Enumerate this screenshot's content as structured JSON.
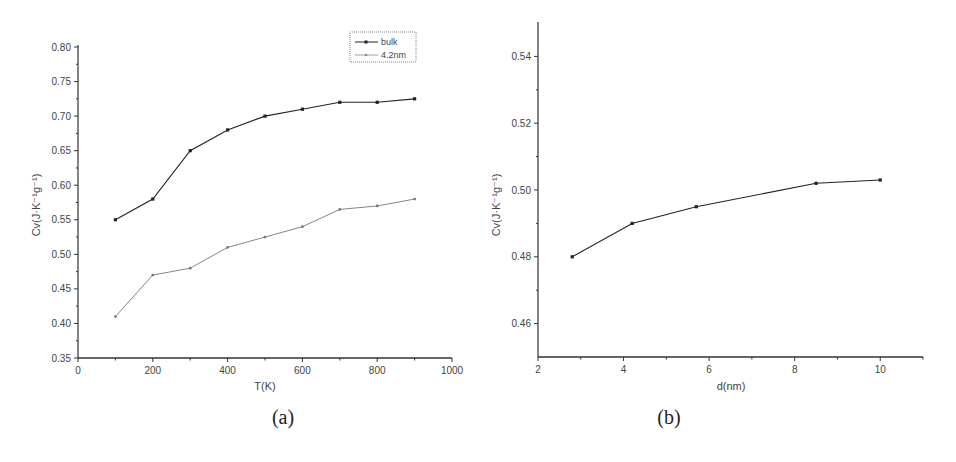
{
  "chart_data": [
    {
      "type": "line",
      "panel": "(a)",
      "xlabel": "T(K)",
      "ylabel": "Cv(J·K⁻¹g⁻¹)",
      "xlim": [
        0,
        1000
      ],
      "ylim": [
        0.35,
        0.8
      ],
      "xticks": [
        "0",
        "200",
        "400",
        "600",
        "800",
        "1000"
      ],
      "yticks": [
        "0.35",
        "0.40",
        "0.45",
        "0.50",
        "0.55",
        "0.60",
        "0.65",
        "0.70",
        "0.75",
        "0.80"
      ],
      "legend_position": "upper right",
      "x": [
        100,
        200,
        300,
        400,
        500,
        600,
        700,
        800,
        900
      ],
      "series": [
        {
          "name": "bulk",
          "values": [
            0.55,
            0.58,
            0.65,
            0.68,
            0.7,
            0.71,
            0.72,
            0.72,
            0.725
          ],
          "color": "#222222"
        },
        {
          "name": "4.2nm",
          "values": [
            0.41,
            0.47,
            0.48,
            0.51,
            0.525,
            0.54,
            0.565,
            0.57,
            0.58
          ],
          "color": "#777777"
        }
      ]
    },
    {
      "type": "line",
      "panel": "(b)",
      "xlabel": "d(nm)",
      "ylabel": "Cv(J·K⁻¹g⁻¹)",
      "xlim": [
        2,
        11
      ],
      "ylim": [
        0.45,
        0.55
      ],
      "xticks": [
        "2",
        "4",
        "6",
        "8",
        "10"
      ],
      "yticks": [
        "0.46",
        "0.48",
        "0.50",
        "0.52",
        "0.54"
      ],
      "x": [
        2.8,
        4.2,
        5.7,
        8.5,
        10
      ],
      "series": [
        {
          "name": "Cv",
          "values": [
            0.48,
            0.49,
            0.495,
            0.502,
            0.503
          ],
          "color": "#222222"
        }
      ]
    }
  ],
  "labels": {
    "a_caption": "(a)",
    "b_caption": "(b)",
    "a_xlabel": "T(K)",
    "b_xlabel": "d(nm)",
    "ylabel": "Cv(J·K⁻¹g⁻¹)",
    "legend_bulk": "bulk",
    "legend_42": "4.2nm"
  }
}
